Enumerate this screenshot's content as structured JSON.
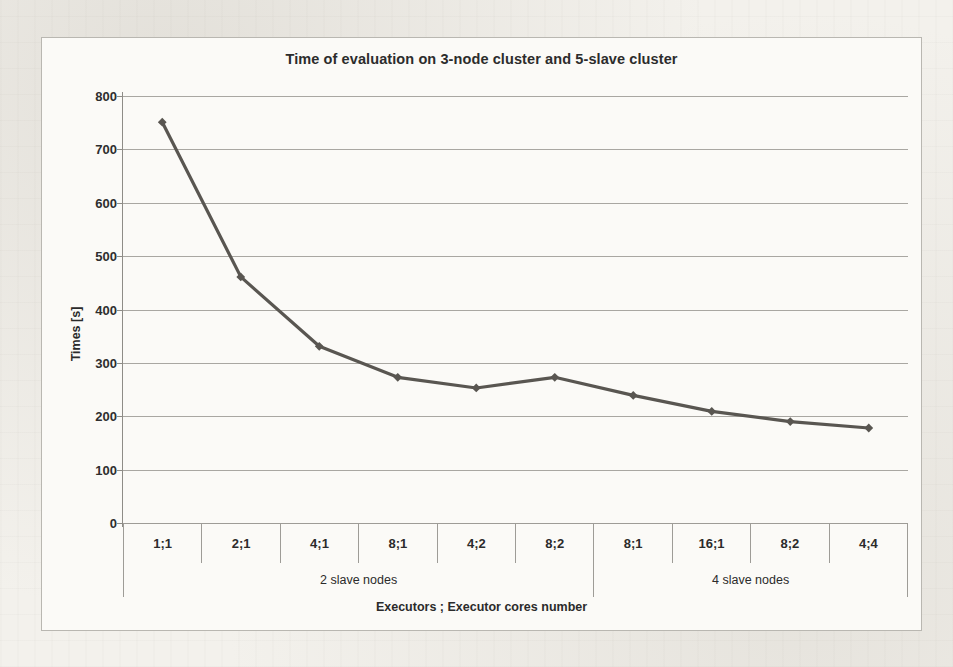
{
  "chart_data": {
    "type": "line",
    "title": "Time of evaluation on 3-node cluster and 5-slave cluster",
    "xlabel": "Executors ; Executor cores number",
    "ylabel": "Times [s]",
    "categories": [
      "1;1",
      "2;1",
      "4;1",
      "8;1",
      "4;2",
      "8;2",
      "8;1",
      "16;1",
      "8;2",
      "4;4"
    ],
    "values": [
      751,
      461,
      331,
      273,
      253,
      273,
      239,
      209,
      190,
      178
    ],
    "series": [
      {
        "name": "Time of evaluation",
        "values": [
          751,
          461,
          331,
          273,
          253,
          273,
          239,
          209,
          190,
          178
        ]
      }
    ],
    "groups": [
      {
        "label": "2 slave nodes",
        "span": 6
      },
      {
        "label": "4 slave nodes",
        "span": 4
      }
    ],
    "ylim": [
      0,
      800
    ],
    "ytick_labels": [
      "800",
      "700",
      "600",
      "500",
      "400",
      "300",
      "200",
      "100",
      "0"
    ],
    "ytick_values": [
      800,
      700,
      600,
      500,
      400,
      300,
      200,
      100,
      0
    ],
    "grid": true,
    "legend": "none",
    "series_color": "#595651",
    "marker": "diamond",
    "gridline_color": "#a9a7a2",
    "axis_color": "#8e8c87",
    "plot_background": "#fbfaf7"
  }
}
